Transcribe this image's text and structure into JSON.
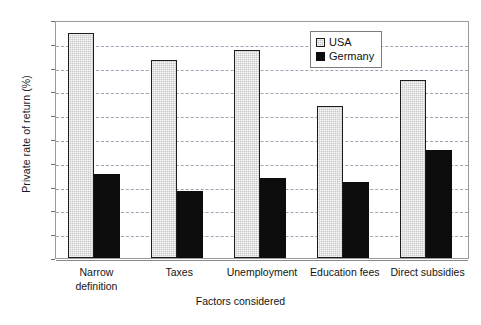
{
  "chart_data": {
    "type": "bar",
    "title": "",
    "xlabel": "Factors considered",
    "ylabel": "Private rate of return (%)",
    "categories": [
      "Narrow\ndefinition",
      "Taxes",
      "Unemployment",
      "Education fees",
      "Direct subsidies"
    ],
    "series": [
      {
        "name": "USA",
        "color": "#c9c9c9",
        "values": [
          18.9,
          16.6,
          17.5,
          12.8,
          15.0
        ]
      },
      {
        "name": "Germany",
        "color": "#0d0d0d",
        "values": [
          7.1,
          5.6,
          6.7,
          6.4,
          9.1
        ]
      }
    ],
    "ylim": [
      0,
      20
    ],
    "yticks": [
      0,
      2,
      4,
      6,
      8,
      10,
      12,
      14,
      16,
      18,
      20
    ],
    "ytick_labels": [
      "0",
      "2",
      "4",
      "6",
      "8",
      "10",
      "12",
      "14",
      "16",
      "18",
      "20"
    ],
    "grid": true,
    "grid_style": "dashed",
    "grid_color": "#9aa6b4",
    "legend_position": "top-right",
    "frame_color": "#9a9a9a"
  },
  "legend": {
    "entries": [
      {
        "label": "USA"
      },
      {
        "label": "Germany"
      }
    ]
  }
}
